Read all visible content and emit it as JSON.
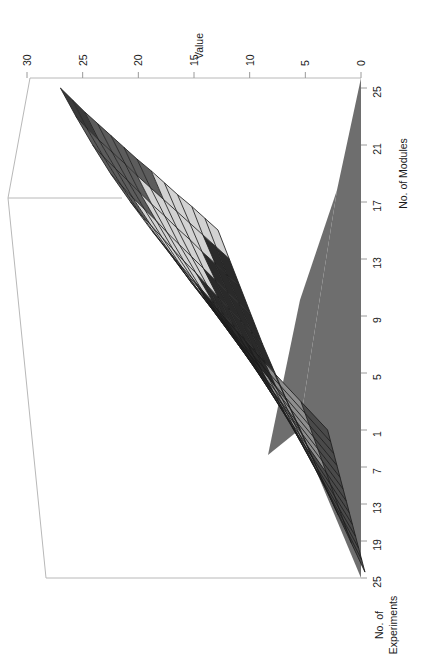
{
  "chart_data": {
    "type": "surface",
    "title": "",
    "rotation_deg": 90,
    "axes": {
      "z": {
        "label": "Value",
        "ticks": [
          "30",
          "25",
          "20",
          "15",
          "10",
          "5",
          "0"
        ],
        "values": [
          30,
          25,
          20,
          15,
          10,
          5,
          0
        ],
        "range": [
          0,
          30
        ]
      },
      "x": {
        "label": "No. of Modules",
        "ticks": [
          "25",
          "21",
          "17",
          "13",
          "9",
          "5",
          "1"
        ],
        "values": [
          25,
          21,
          17,
          13,
          9,
          5,
          1
        ],
        "range": [
          1,
          25
        ]
      },
      "y": {
        "label": "No. of Experiments",
        "ticks": [
          "1",
          "7",
          "13",
          "19",
          "25"
        ],
        "values": [
          1,
          7,
          13,
          19,
          25
        ],
        "range": [
          1,
          25
        ]
      }
    },
    "bands": [
      {
        "name": "band-0-5",
        "range": [
          0,
          5
        ],
        "color": "#4a4a4a"
      },
      {
        "name": "band-5-10",
        "range": [
          5,
          10
        ],
        "color": "#8e8e8e"
      },
      {
        "name": "band-10-15",
        "range": [
          10,
          15
        ],
        "color": "#2a2a2a"
      },
      {
        "name": "band-15-20",
        "range": [
          15,
          20
        ],
        "color": "#d2d2d2"
      },
      {
        "name": "band-20-25",
        "range": [
          20,
          25
        ],
        "color": "#5c5c5c"
      },
      {
        "name": "band-25-30",
        "range": [
          25,
          30
        ],
        "color": "#3a3a3a"
      }
    ],
    "base_plane_color": "#6e6e6e",
    "grid_color": "#1c1c1c",
    "frame_color": "#b8b8b8",
    "grid_rows": 13,
    "grid_cols": 13,
    "series": [
      {
        "name": "experiments-1",
        "modules": [
          1,
          3,
          5,
          7,
          9,
          11,
          13,
          15,
          17,
          19,
          21,
          23,
          25
        ],
        "values": [
          3.0,
          5.4,
          7.8,
          10.1,
          12.4,
          14.6,
          16.8,
          18.8,
          20.7,
          22.5,
          24.1,
          25.6,
          27.0
        ]
      },
      {
        "name": "experiments-3",
        "modules": [
          1,
          3,
          5,
          7,
          9,
          11,
          13,
          15,
          17,
          19,
          21,
          23,
          25
        ],
        "values": [
          2.9,
          5.2,
          7.5,
          9.8,
          12.0,
          14.1,
          16.2,
          18.1,
          20.0,
          21.7,
          23.3,
          24.8,
          26.1
        ]
      },
      {
        "name": "experiments-5",
        "modules": [
          1,
          3,
          5,
          7,
          9,
          11,
          13,
          15,
          17,
          19,
          21,
          23,
          25
        ],
        "values": [
          2.8,
          5.0,
          7.2,
          9.4,
          11.5,
          13.6,
          15.6,
          17.4,
          19.2,
          20.9,
          22.4,
          23.9,
          25.2
        ]
      },
      {
        "name": "experiments-7",
        "modules": [
          1,
          3,
          5,
          7,
          9,
          11,
          13,
          15,
          17,
          19,
          21,
          23,
          25
        ],
        "values": [
          2.7,
          4.8,
          6.9,
          9.0,
          11.0,
          13.0,
          14.9,
          16.7,
          18.4,
          20.0,
          21.5,
          22.9,
          24.2
        ]
      },
      {
        "name": "experiments-9",
        "modules": [
          1,
          3,
          5,
          7,
          9,
          11,
          13,
          15,
          17,
          19,
          21,
          23,
          25
        ],
        "values": [
          2.6,
          4.6,
          6.6,
          8.6,
          10.5,
          12.4,
          14.2,
          15.9,
          17.6,
          19.1,
          20.6,
          21.9,
          23.2
        ]
      },
      {
        "name": "experiments-11",
        "modules": [
          1,
          3,
          5,
          7,
          9,
          11,
          13,
          15,
          17,
          19,
          21,
          23,
          25
        ],
        "values": [
          2.5,
          4.4,
          6.3,
          8.2,
          10.0,
          11.8,
          13.5,
          15.2,
          16.8,
          18.3,
          19.7,
          21.0,
          22.2
        ]
      },
      {
        "name": "experiments-13",
        "modules": [
          1,
          3,
          5,
          7,
          9,
          11,
          13,
          15,
          17,
          19,
          21,
          23,
          25
        ],
        "values": [
          2.4,
          4.2,
          6.0,
          7.8,
          9.5,
          11.2,
          12.9,
          14.4,
          15.9,
          17.4,
          18.7,
          20.0,
          21.2
        ]
      },
      {
        "name": "experiments-15",
        "modules": [
          1,
          3,
          5,
          7,
          9,
          11,
          13,
          15,
          17,
          19,
          21,
          23,
          25
        ],
        "values": [
          2.3,
          4.0,
          5.7,
          7.4,
          9.0,
          10.6,
          12.2,
          13.7,
          15.1,
          16.5,
          17.8,
          19.0,
          20.1
        ]
      },
      {
        "name": "experiments-17",
        "modules": [
          1,
          3,
          5,
          7,
          9,
          11,
          13,
          15,
          17,
          19,
          21,
          23,
          25
        ],
        "values": [
          2.2,
          3.8,
          5.4,
          7.0,
          8.5,
          10.0,
          11.5,
          12.9,
          14.3,
          15.6,
          16.8,
          18.0,
          19.1
        ]
      },
      {
        "name": "experiments-19",
        "modules": [
          1,
          3,
          5,
          7,
          9,
          11,
          13,
          15,
          17,
          19,
          21,
          23,
          25
        ],
        "values": [
          2.1,
          3.6,
          5.1,
          6.6,
          8.0,
          9.4,
          10.8,
          12.2,
          13.5,
          14.7,
          15.9,
          17.0,
          18.1
        ]
      },
      {
        "name": "experiments-21",
        "modules": [
          1,
          3,
          5,
          7,
          9,
          11,
          13,
          15,
          17,
          19,
          21,
          23,
          25
        ],
        "values": [
          2.0,
          3.4,
          4.8,
          6.2,
          7.5,
          8.8,
          10.1,
          11.4,
          12.6,
          13.8,
          14.9,
          16.0,
          17.0
        ]
      },
      {
        "name": "experiments-23",
        "modules": [
          1,
          3,
          5,
          7,
          9,
          11,
          13,
          15,
          17,
          19,
          21,
          23,
          25
        ],
        "values": [
          1.9,
          3.2,
          4.5,
          5.8,
          7.0,
          8.2,
          9.5,
          10.7,
          11.8,
          12.9,
          14.0,
          15.0,
          16.0
        ]
      },
      {
        "name": "experiments-25",
        "modules": [
          1,
          3,
          5,
          7,
          9,
          11,
          13,
          15,
          17,
          19,
          21,
          23,
          25
        ],
        "values": [
          1.8,
          3.0,
          4.2,
          5.4,
          6.5,
          7.6,
          8.8,
          9.9,
          11.0,
          12.0,
          13.0,
          14.0,
          15.0
        ]
      }
    ]
  },
  "labels": {
    "value_axis_title": "Value",
    "modules_axis_title": "No. of Modules",
    "experiments_axis_title_line1": "No. of",
    "experiments_axis_title_line2": "Experiments",
    "value_ticks": [
      "30",
      "25",
      "20",
      "15",
      "10",
      "5",
      "0"
    ],
    "modules_ticks": [
      "25",
      "21",
      "17",
      "13",
      "9",
      "5",
      "1"
    ],
    "experiments_ticks": [
      "7",
      "13",
      "19",
      "25"
    ]
  }
}
